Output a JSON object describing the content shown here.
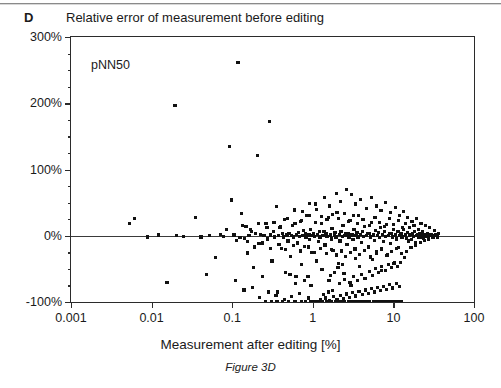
{
  "panel": {
    "label": "D"
  },
  "chart_data": {
    "type": "scatter",
    "title": "Relative error of measurement before editing",
    "xlabel": "Measurement after editing [%]",
    "ylabel": "",
    "caption": "Figure 3D",
    "annotation": "pNN50",
    "xscale": "log",
    "xlim": [
      0.001,
      100
    ],
    "ylim": [
      -100,
      300
    ],
    "grid": false,
    "legend": null,
    "marker_color": "#111111",
    "axis_color": "#2b2b2b",
    "reference_line_y": 0,
    "xticklabels": [
      "0.001",
      "0.01",
      "0.1",
      "1",
      "10",
      "100"
    ],
    "xtickvalues": [
      0.001,
      0.01,
      0.1,
      1,
      10,
      100
    ],
    "yticklabels": [
      "300%",
      "200%",
      "100%",
      "0%",
      "-100%"
    ],
    "ytickvalues": [
      300,
      200,
      100,
      0,
      -100
    ],
    "yminorstep": 25,
    "points": [
      [
        0.0053,
        18
      ],
      [
        0.0062,
        26
      ],
      [
        0.0155,
        -70
      ],
      [
        0.0195,
        197
      ],
      [
        0.0088,
        -2
      ],
      [
        0.0122,
        1
      ],
      [
        0.0205,
        0
      ],
      [
        0.0246,
        -1
      ],
      [
        0.035,
        27
      ],
      [
        0.041,
        -2
      ],
      [
        0.048,
        -58
      ],
      [
        0.052,
        0
      ],
      [
        0.062,
        -33
      ],
      [
        0.072,
        2
      ],
      [
        0.078,
        -1
      ],
      [
        0.085,
        10
      ],
      [
        0.092,
        135
      ],
      [
        0.098,
        54
      ],
      [
        0.105,
        1
      ],
      [
        0.112,
        -7
      ],
      [
        0.118,
        262
      ],
      [
        0.125,
        -3
      ],
      [
        0.131,
        33
      ],
      [
        0.142,
        -4
      ],
      [
        0.148,
        14
      ],
      [
        0.155,
        -26
      ],
      [
        0.162,
        0
      ],
      [
        0.175,
        6
      ],
      [
        0.182,
        -48
      ],
      [
        0.195,
        3
      ],
      [
        0.205,
        121
      ],
      [
        0.215,
        -12
      ],
      [
        0.225,
        2
      ],
      [
        0.238,
        -61
      ],
      [
        0.248,
        0
      ],
      [
        0.262,
        18
      ],
      [
        0.275,
        -5
      ],
      [
        0.288,
        173
      ],
      [
        0.298,
        1
      ],
      [
        0.312,
        -38
      ],
      [
        0.325,
        7
      ],
      [
        0.338,
        -2
      ],
      [
        0.352,
        44
      ],
      [
        0.365,
        -85
      ],
      [
        0.378,
        0
      ],
      [
        0.392,
        12
      ],
      [
        0.405,
        -19
      ],
      [
        0.418,
        3
      ],
      [
        0.432,
        -2
      ],
      [
        0.448,
        25
      ],
      [
        0.462,
        -55
      ],
      [
        0.478,
        1
      ],
      [
        0.492,
        -8
      ],
      [
        0.508,
        4
      ],
      [
        0.525,
        -31
      ],
      [
        0.542,
        0
      ],
      [
        0.558,
        16
      ],
      [
        0.575,
        -2
      ],
      [
        0.592,
        39
      ],
      [
        0.612,
        -72
      ],
      [
        0.628,
        2
      ],
      [
        0.645,
        -11
      ],
      [
        0.665,
        5
      ],
      [
        0.682,
        -1
      ],
      [
        0.702,
        22
      ],
      [
        0.722,
        -44
      ],
      [
        0.742,
        0
      ],
      [
        0.762,
        8
      ],
      [
        0.782,
        -16
      ],
      [
        0.805,
        3
      ],
      [
        0.825,
        -2
      ],
      [
        0.848,
        30
      ],
      [
        0.872,
        -62
      ],
      [
        0.895,
        1
      ],
      [
        0.918,
        -6
      ],
      [
        0.942,
        10
      ],
      [
        0.968,
        -25
      ],
      [
        0.992,
        0
      ],
      [
        1.02,
        4
      ],
      [
        1.05,
        -1
      ],
      [
        1.08,
        48
      ],
      [
        1.11,
        -38
      ],
      [
        1.14,
        2
      ],
      [
        1.17,
        -9
      ],
      [
        1.2,
        6
      ],
      [
        1.23,
        -2
      ],
      [
        1.27,
        19
      ],
      [
        1.3,
        -51
      ],
      [
        1.34,
        0
      ],
      [
        1.38,
        7
      ],
      [
        1.42,
        -14
      ],
      [
        1.46,
        3
      ],
      [
        1.5,
        -1
      ],
      [
        1.55,
        27
      ],
      [
        1.59,
        -68
      ],
      [
        1.64,
        1
      ],
      [
        1.69,
        -5
      ],
      [
        1.73,
        11
      ],
      [
        1.78,
        -22
      ],
      [
        1.84,
        0
      ],
      [
        1.89,
        5
      ],
      [
        1.94,
        -2
      ],
      [
        2.0,
        35
      ],
      [
        2.06,
        -42
      ],
      [
        2.12,
        2
      ],
      [
        2.18,
        -8
      ],
      [
        2.24,
        7
      ],
      [
        2.31,
        -1
      ],
      [
        2.37,
        16
      ],
      [
        2.44,
        -57
      ],
      [
        2.51,
        0
      ],
      [
        2.58,
        4
      ],
      [
        2.66,
        -13
      ],
      [
        2.73,
        3
      ],
      [
        2.81,
        -2
      ],
      [
        2.89,
        23
      ],
      [
        2.98,
        -75
      ],
      [
        3.06,
        1
      ],
      [
        3.15,
        -6
      ],
      [
        3.24,
        9
      ],
      [
        3.33,
        -20
      ],
      [
        3.43,
        0
      ],
      [
        3.53,
        5
      ],
      [
        3.63,
        -2
      ],
      [
        3.73,
        31
      ],
      [
        3.84,
        -47
      ],
      [
        3.95,
        2
      ],
      [
        4.06,
        -10
      ],
      [
        4.18,
        6
      ],
      [
        4.3,
        -1
      ],
      [
        4.42,
        14
      ],
      [
        4.55,
        -64
      ],
      [
        4.68,
        0
      ],
      [
        4.82,
        4
      ],
      [
        4.95,
        -17
      ],
      [
        5.1,
        3
      ],
      [
        5.24,
        -2
      ],
      [
        5.39,
        20
      ],
      [
        5.55,
        -36
      ],
      [
        5.71,
        1
      ],
      [
        5.87,
        -7
      ],
      [
        6.04,
        8
      ],
      [
        6.22,
        -24
      ],
      [
        6.4,
        0
      ],
      [
        6.58,
        5
      ],
      [
        6.77,
        -3
      ],
      [
        6.97,
        12
      ],
      [
        7.17,
        -53
      ],
      [
        7.38,
        2
      ],
      [
        7.59,
        -9
      ],
      [
        7.81,
        6
      ],
      [
        8.04,
        -1
      ],
      [
        8.27,
        17
      ],
      [
        8.51,
        -29
      ],
      [
        8.76,
        0
      ],
      [
        9.01,
        4
      ],
      [
        9.27,
        -12
      ],
      [
        9.54,
        3
      ],
      [
        9.82,
        -2
      ],
      [
        10.1,
        10
      ],
      [
        10.4,
        -40
      ],
      [
        10.7,
        1
      ],
      [
        11.0,
        -5
      ],
      [
        11.4,
        7
      ],
      [
        11.7,
        -18
      ],
      [
        12.0,
        0
      ],
      [
        12.4,
        3
      ],
      [
        12.8,
        -2
      ],
      [
        13.2,
        9
      ],
      [
        13.6,
        -33
      ],
      [
        14.0,
        1
      ],
      [
        14.4,
        -4
      ],
      [
        14.9,
        5
      ],
      [
        15.3,
        -8
      ],
      [
        15.8,
        0
      ],
      [
        16.3,
        2
      ],
      [
        16.8,
        -6
      ],
      [
        17.3,
        4
      ],
      [
        17.8,
        -1
      ],
      [
        18.4,
        6
      ],
      [
        18.9,
        -11
      ],
      [
        19.5,
        0
      ],
      [
        20.1,
        2
      ],
      [
        20.7,
        -3
      ],
      [
        21.4,
        3
      ],
      [
        22.0,
        -2
      ],
      [
        22.7,
        1
      ],
      [
        23.4,
        -4
      ],
      [
        24.1,
        0
      ],
      [
        25.0,
        1
      ],
      [
        26.0,
        -1
      ],
      [
        27.5,
        0
      ],
      [
        29.0,
        1
      ],
      [
        30.5,
        0
      ],
      [
        0.95,
        -100
      ],
      [
        1.05,
        -100
      ],
      [
        1.15,
        -100
      ],
      [
        1.3,
        -100
      ],
      [
        1.5,
        -100
      ],
      [
        1.7,
        -100
      ],
      [
        1.9,
        -100
      ],
      [
        2.1,
        -100
      ],
      [
        2.3,
        -100
      ],
      [
        2.5,
        -100
      ],
      [
        2.75,
        -100
      ],
      [
        3.0,
        -100
      ],
      [
        3.3,
        -100
      ],
      [
        3.6,
        -100
      ],
      [
        3.9,
        -100
      ],
      [
        4.3,
        -100
      ],
      [
        4.7,
        -100
      ],
      [
        5.1,
        -100
      ],
      [
        5.6,
        -100
      ],
      [
        6.1,
        -100
      ],
      [
        6.7,
        -100
      ],
      [
        7.3,
        -100
      ],
      [
        8.0,
        -100
      ],
      [
        8.8,
        -100
      ],
      [
        9.6,
        -100
      ],
      [
        10.5,
        -100
      ],
      [
        11.5,
        -100
      ],
      [
        12.6,
        -100
      ],
      [
        0.42,
        -100
      ],
      [
        0.5,
        -100
      ],
      [
        0.6,
        -100
      ],
      [
        0.72,
        -100
      ],
      [
        0.82,
        -100
      ],
      [
        0.26,
        -100
      ],
      [
        0.31,
        -100
      ],
      [
        0.36,
        -100
      ],
      [
        1.25,
        -97
      ],
      [
        1.45,
        -94
      ],
      [
        1.6,
        -98
      ],
      [
        1.8,
        -92
      ],
      [
        2.0,
        -96
      ],
      [
        2.2,
        -90
      ],
      [
        2.4,
        -95
      ],
      [
        2.6,
        -88
      ],
      [
        2.85,
        -93
      ],
      [
        3.1,
        -86
      ],
      [
        3.4,
        -91
      ],
      [
        3.75,
        -84
      ],
      [
        4.1,
        -89
      ],
      [
        4.5,
        -82
      ],
      [
        4.9,
        -87
      ],
      [
        5.3,
        -80
      ],
      [
        5.8,
        -85
      ],
      [
        6.3,
        -78
      ],
      [
        6.9,
        -83
      ],
      [
        7.5,
        -76
      ],
      [
        8.2,
        -81
      ],
      [
        9.0,
        -74
      ],
      [
        9.8,
        -79
      ],
      [
        10.8,
        -72
      ],
      [
        11.8,
        -77
      ],
      [
        1.35,
        -89
      ],
      [
        1.55,
        -85
      ],
      [
        1.75,
        -83
      ],
      [
        0.55,
        -92
      ],
      [
        0.68,
        -87
      ],
      [
        0.88,
        -94
      ],
      [
        0.35,
        -90
      ],
      [
        0.45,
        -96
      ],
      [
        0.22,
        -93
      ],
      [
        0.28,
        -85
      ],
      [
        0.18,
        -78
      ],
      [
        0.14,
        -82
      ],
      [
        0.11,
        -68
      ],
      [
        2.15,
        -72
      ],
      [
        2.45,
        -66
      ],
      [
        2.9,
        -70
      ],
      [
        3.2,
        -62
      ],
      [
        3.55,
        -68
      ],
      [
        4.0,
        -58
      ],
      [
        4.4,
        -64
      ],
      [
        5.0,
        -54
      ],
      [
        5.5,
        -60
      ],
      [
        6.0,
        -50
      ],
      [
        6.6,
        -56
      ],
      [
        7.2,
        -46
      ],
      [
        7.9,
        -52
      ],
      [
        8.6,
        -44
      ],
      [
        9.4,
        -48
      ],
      [
        10.2,
        -42
      ],
      [
        11.2,
        -46
      ],
      [
        12.2,
        -40
      ],
      [
        1.65,
        -60
      ],
      [
        1.85,
        -55
      ],
      [
        2.05,
        -48
      ],
      [
        2.35,
        -44
      ],
      [
        0.95,
        -75
      ],
      [
        0.78,
        -68
      ],
      [
        0.62,
        -62
      ],
      [
        0.52,
        -58
      ],
      [
        3.0,
        62
      ],
      [
        3.4,
        48
      ],
      [
        3.9,
        55
      ],
      [
        4.6,
        41
      ],
      [
        5.4,
        58
      ],
      [
        6.2,
        45
      ],
      [
        7.0,
        38
      ],
      [
        8.0,
        50
      ],
      [
        9.2,
        35
      ],
      [
        10.5,
        43
      ],
      [
        12.0,
        30
      ],
      [
        13.5,
        36
      ],
      [
        2.6,
        70
      ],
      [
        2.2,
        52
      ],
      [
        1.95,
        64
      ],
      [
        1.6,
        45
      ],
      [
        1.4,
        58
      ],
      [
        1.1,
        40
      ],
      [
        0.92,
        49
      ],
      [
        0.75,
        36
      ],
      [
        15.0,
        28
      ],
      [
        17.0,
        22
      ],
      [
        19.5,
        26
      ],
      [
        22.0,
        18
      ],
      [
        25.0,
        15
      ],
      [
        28.0,
        12
      ],
      [
        32.0,
        8
      ],
      [
        36.0,
        4
      ],
      [
        14.0,
        18
      ],
      [
        16.0,
        12
      ],
      [
        18.0,
        15
      ],
      [
        20.5,
        9
      ],
      [
        23.0,
        6
      ],
      [
        26.5,
        3
      ],
      [
        30.0,
        2
      ],
      [
        33.0,
        1
      ],
      [
        14.5,
        -24
      ],
      [
        16.5,
        -18
      ],
      [
        19.0,
        -14
      ],
      [
        21.5,
        -10
      ],
      [
        24.5,
        -7
      ],
      [
        27.0,
        -5
      ],
      [
        31.0,
        -3
      ],
      [
        35.0,
        -2
      ],
      [
        3.6,
        18
      ],
      [
        4.2,
        24
      ],
      [
        5.0,
        16
      ],
      [
        5.9,
        28
      ],
      [
        6.8,
        20
      ],
      [
        7.8,
        14
      ],
      [
        8.9,
        26
      ],
      [
        10.0,
        17
      ],
      [
        11.5,
        23
      ],
      [
        13.0,
        13
      ],
      [
        3.2,
        30
      ],
      [
        2.8,
        22
      ],
      [
        2.45,
        34
      ],
      [
        2.1,
        26
      ],
      [
        1.75,
        32
      ],
      [
        1.5,
        24
      ],
      [
        1.28,
        29
      ],
      [
        1.08,
        20
      ],
      [
        0.9,
        31
      ],
      [
        0.72,
        23
      ],
      [
        0.6,
        18
      ],
      [
        0.48,
        26
      ],
      [
        0.4,
        14
      ],
      [
        0.33,
        20
      ],
      [
        0.27,
        12
      ],
      [
        0.21,
        18
      ],
      [
        0.17,
        9
      ],
      [
        0.135,
        15
      ],
      [
        3.8,
        -28
      ],
      [
        4.4,
        -22
      ],
      [
        5.2,
        -32
      ],
      [
        6.1,
        -26
      ],
      [
        7.1,
        -20
      ],
      [
        8.3,
        -30
      ],
      [
        9.5,
        -24
      ],
      [
        11.0,
        -19
      ],
      [
        12.5,
        -27
      ],
      [
        3.35,
        -34
      ],
      [
        2.95,
        -25
      ],
      [
        2.55,
        -31
      ],
      [
        2.25,
        -23
      ],
      [
        1.98,
        -29
      ],
      [
        1.72,
        -21
      ],
      [
        1.48,
        -27
      ],
      [
        1.26,
        -19
      ],
      [
        1.06,
        -25
      ],
      [
        0.88,
        -17
      ],
      [
        0.7,
        -23
      ],
      [
        0.57,
        -15
      ],
      [
        0.46,
        -21
      ],
      [
        0.38,
        -13
      ],
      [
        0.3,
        -19
      ],
      [
        0.24,
        -11
      ],
      [
        0.19,
        -17
      ],
      [
        0.155,
        -9
      ]
    ]
  }
}
